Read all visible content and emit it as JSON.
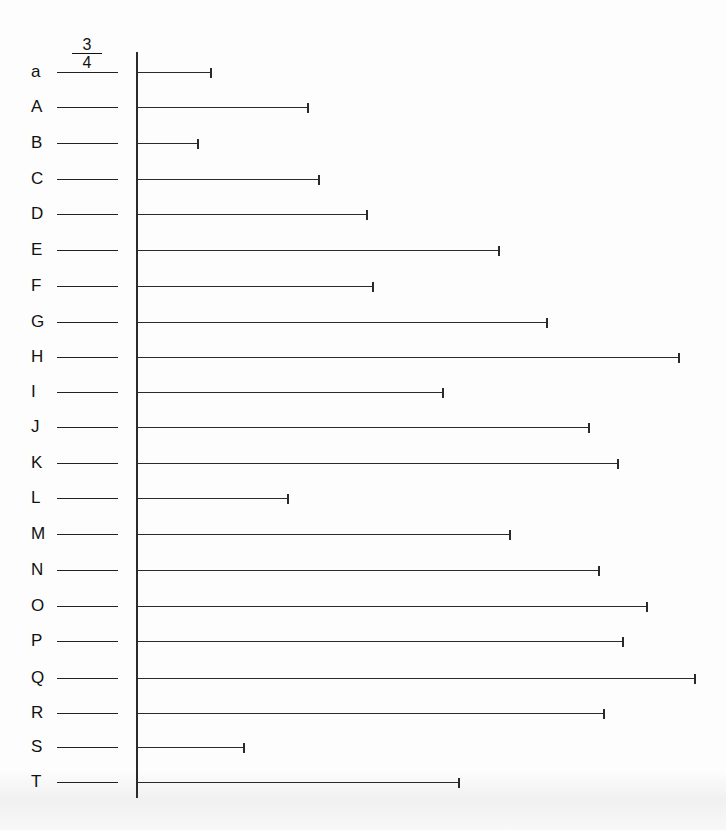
{
  "worksheet": {
    "example": {
      "label": "a",
      "answer_numerator": "3",
      "answer_denominator": "4"
    },
    "axis": {
      "x": 136,
      "top": 52,
      "bottom": 798
    },
    "rows": [
      {
        "label": "a",
        "bar_length_px": 73,
        "answer": "3/4",
        "y": 72
      },
      {
        "label": "A",
        "bar_length_px": 170,
        "answer": "",
        "y": 107
      },
      {
        "label": "B",
        "bar_length_px": 60,
        "answer": "",
        "y": 143
      },
      {
        "label": "C",
        "bar_length_px": 181,
        "answer": "",
        "y": 179
      },
      {
        "label": "D",
        "bar_length_px": 229,
        "answer": "",
        "y": 214
      },
      {
        "label": "E",
        "bar_length_px": 361,
        "answer": "",
        "y": 250
      },
      {
        "label": "F",
        "bar_length_px": 235,
        "answer": "",
        "y": 286
      },
      {
        "label": "G",
        "bar_length_px": 409,
        "answer": "",
        "y": 322
      },
      {
        "label": "H",
        "bar_length_px": 541,
        "answer": "",
        "y": 357
      },
      {
        "label": "I",
        "bar_length_px": 305,
        "answer": "",
        "y": 392
      },
      {
        "label": "J",
        "bar_length_px": 451,
        "answer": "",
        "y": 427
      },
      {
        "label": "K",
        "bar_length_px": 480,
        "answer": "",
        "y": 463
      },
      {
        "label": "L",
        "bar_length_px": 150,
        "answer": "",
        "y": 498
      },
      {
        "label": "M",
        "bar_length_px": 372,
        "answer": "",
        "y": 534
      },
      {
        "label": "N",
        "bar_length_px": 461,
        "answer": "",
        "y": 570
      },
      {
        "label": "O",
        "bar_length_px": 509,
        "answer": "",
        "y": 606
      },
      {
        "label": "P",
        "bar_length_px": 485,
        "answer": "",
        "y": 641
      },
      {
        "label": "Q",
        "bar_length_px": 557,
        "answer": "",
        "y": 678
      },
      {
        "label": "R",
        "bar_length_px": 466,
        "answer": "",
        "y": 713
      },
      {
        "label": "S",
        "bar_length_px": 106,
        "answer": "",
        "y": 747
      },
      {
        "label": "T",
        "bar_length_px": 321,
        "answer": "",
        "y": 782
      }
    ]
  }
}
